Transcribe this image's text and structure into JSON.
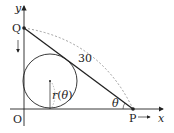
{
  "diagram": {
    "labels": {
      "y_axis": "y",
      "x_axis": "x",
      "origin": "O",
      "point_q": "Q",
      "point_p": "P",
      "length": "30",
      "radius": "r(θ)",
      "angle": "θ"
    },
    "colors": {
      "line": "#222222",
      "dashed": "#888888",
      "background": "#ffffff"
    }
  }
}
